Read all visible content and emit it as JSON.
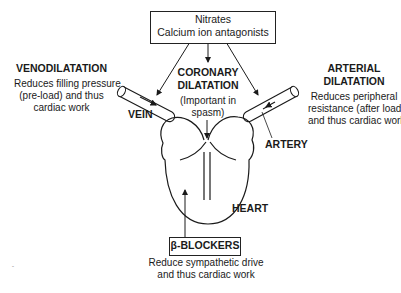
{
  "top_box": {
    "line1": "Nitrates",
    "line2": "Calcium ion antagonists"
  },
  "venodilatation": {
    "title": "VENODILATATION",
    "desc_line1": "Reduces filling pressure",
    "desc_line2": "(pre-load) and thus",
    "desc_line3": "cardiac work"
  },
  "coronary": {
    "title_line1": "CORONARY",
    "title_line2": "DILATATION",
    "note_line1": "(Important in",
    "note_line2": "spasm)"
  },
  "arterial": {
    "title_line1": "ARTERIAL",
    "title_line2": "DILATATION",
    "desc_line1": "Reduces peripheral",
    "desc_line2": "resistance (after load)",
    "desc_line3": "and thus cardiac work"
  },
  "labels": {
    "vein": "VEIN",
    "artery": "ARTERY",
    "heart": "HEART"
  },
  "bottom_box": {
    "label": "β-BLOCKERS",
    "desc_line1": "Reduce sympathetic drive",
    "desc_line2": "and thus cardiac work"
  },
  "colors": {
    "ink": "#1a1a1a",
    "background": "#ffffff"
  }
}
